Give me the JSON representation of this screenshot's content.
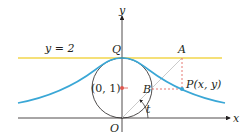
{
  "figure": {
    "labels": {
      "y_axis": "y",
      "x_axis": "x",
      "line": "y = 2",
      "point_Q": "Q",
      "point_A": "A",
      "point_P": "P(x, y)",
      "point_B": "B",
      "center": "(0, 1)",
      "origin": "O",
      "angle": "t"
    },
    "colors": {
      "curve": "#3aa7d6",
      "line_y2": "#f2d64b",
      "axes": "#231f20",
      "circle": "#231f20",
      "dashed": "#e0574f",
      "center_dot": "#e0574f",
      "point_P": "#3aa7d6",
      "radial_line": "#bdbdbd"
    }
  }
}
